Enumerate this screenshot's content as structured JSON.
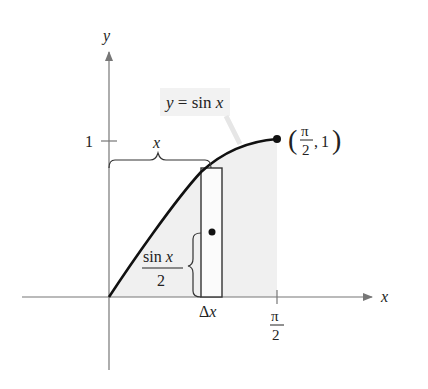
{
  "diagram": {
    "type": "area-under-curve",
    "function_label": "y = sin x",
    "axes": {
      "x_label": "x",
      "y_label": "y"
    },
    "ticks": {
      "y_tick_label": "1",
      "x_tick_label_num": "π",
      "x_tick_label_den": "2"
    },
    "point": {
      "label_num": "π",
      "label_den": "2",
      "label_y": "1",
      "open_paren": "(",
      "close_paren": ")",
      "comma": ","
    },
    "braces": {
      "horizontal_label": "x",
      "vertical_label_num": "sin x",
      "vertical_label_den": "2"
    },
    "rectangle": {
      "width_label": "Δx"
    },
    "colors": {
      "curve": "#111111",
      "axis": "#777777",
      "shade": "#f0f0f0",
      "label_bg": "#f2f2f2"
    }
  }
}
